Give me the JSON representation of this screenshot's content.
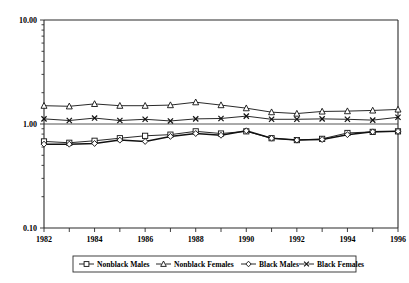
{
  "chart_data": {
    "type": "line",
    "title": "",
    "subtitle": "",
    "xlabel": "",
    "ylabel": "",
    "yscale": "log",
    "ylim": [
      0.1,
      10.0
    ],
    "xlim": [
      1982,
      1996
    ],
    "grid": true,
    "grid_values": [
      1.0
    ],
    "legend_position": "bottom",
    "ytick_labels": [
      "10.00",
      "1.00",
      "0.10"
    ],
    "ytick_values": [
      10.0,
      1.0,
      0.1
    ],
    "xtick_labels": [
      "1982",
      "1984",
      "1986",
      "1988",
      "1990",
      "1992",
      "1994",
      "1996"
    ],
    "xtick_values": [
      1982,
      1984,
      1986,
      1988,
      1990,
      1992,
      1994,
      1996
    ],
    "x": [
      1982,
      1983,
      1984,
      1985,
      1986,
      1987,
      1988,
      1989,
      1990,
      1991,
      1992,
      1993,
      1994,
      1995,
      1996
    ],
    "series": [
      {
        "name": "Nonblack Males",
        "marker": "square",
        "values": [
          0.68,
          0.66,
          0.69,
          0.73,
          0.77,
          0.79,
          0.85,
          0.81,
          0.85,
          0.73,
          0.7,
          0.72,
          0.82,
          0.84,
          0.85
        ]
      },
      {
        "name": "Nonblack Females",
        "marker": "triangle",
        "values": [
          1.5,
          1.48,
          1.56,
          1.5,
          1.5,
          1.52,
          1.62,
          1.52,
          1.42,
          1.3,
          1.26,
          1.32,
          1.33,
          1.35,
          1.38
        ]
      },
      {
        "name": "Black Males",
        "marker": "diamond",
        "values": [
          0.64,
          0.64,
          0.65,
          0.7,
          0.68,
          0.76,
          0.81,
          0.78,
          0.86,
          0.73,
          0.7,
          0.71,
          0.79,
          0.84,
          0.85
        ]
      },
      {
        "name": "Black Females",
        "marker": "x",
        "values": [
          1.12,
          1.08,
          1.14,
          1.08,
          1.11,
          1.07,
          1.12,
          1.13,
          1.19,
          1.11,
          1.11,
          1.12,
          1.11,
          1.09,
          1.16
        ]
      }
    ]
  },
  "legend": {
    "items": [
      {
        "label": "Nonblack Males",
        "marker": "square"
      },
      {
        "label": "Nonblack Females",
        "marker": "triangle"
      },
      {
        "label": "Black Males",
        "marker": "diamond"
      },
      {
        "label": "Black Females",
        "marker": "x"
      }
    ]
  },
  "colors": {
    "line": "#111111",
    "marker_fill": "#ffffff",
    "frame": "#2b2b2b",
    "grid": "#555555",
    "background": "#ffffff"
  }
}
